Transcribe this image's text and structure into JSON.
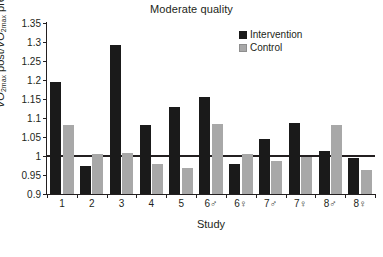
{
  "chart_data": {
    "type": "bar",
    "title": "Moderate quality",
    "xlabel": "Study",
    "ylabel": "VO2max post/VO2max pre",
    "ylim": [
      0.9,
      1.35
    ],
    "yticks": [
      0.9,
      0.95,
      1,
      1.05,
      1.1,
      1.15,
      1.2,
      1.25,
      1.3,
      1.35
    ],
    "ytick_labels": [
      "0.9",
      "0.95",
      "1",
      "1.05",
      "1.1",
      "1.15",
      "1.2",
      "1.25",
      "1.3",
      "1.35"
    ],
    "grid": false,
    "legend_position": "top-right",
    "reference_line": 1.0,
    "categories": [
      "1",
      "2",
      "3",
      "4",
      "5",
      "6♂",
      "6♀",
      "7♂",
      "7♀",
      "8♂",
      "8♀"
    ],
    "series": [
      {
        "name": "Intervention",
        "color": "#1a1a1a",
        "values": [
          1.195,
          0.974,
          1.291,
          1.082,
          1.129,
          1.155,
          0.978,
          1.044,
          1.088,
          1.013,
          0.995
        ]
      },
      {
        "name": "Control",
        "color": "#a8a8a8",
        "values": [
          1.082,
          1.004,
          1.008,
          0.98,
          0.968,
          1.083,
          1.005,
          0.988,
          0.998,
          1.081,
          0.963
        ]
      }
    ]
  },
  "legend": {
    "items": [
      {
        "label": "Intervention",
        "color": "#1a1a1a"
      },
      {
        "label": "Control",
        "color": "#a8a8a8"
      }
    ]
  }
}
